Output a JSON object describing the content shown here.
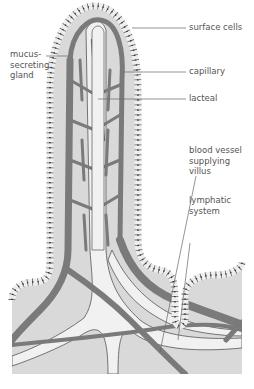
{
  "diagram": {
    "colors": {
      "tissue": "#d9d9d9",
      "lacteal": "#f1f1f1",
      "vessel": "#7a7a7a",
      "outline": "#555555",
      "cell": "#eeeeee",
      "text": "#555555"
    },
    "labels": [
      {
        "id": "surface-cells",
        "text": "surface cells"
      },
      {
        "id": "mucus-gland",
        "text": "mucus-\nsecreting\ngland"
      },
      {
        "id": "capillary",
        "text": "capillary"
      },
      {
        "id": "lacteal",
        "text": "lacteal"
      },
      {
        "id": "blood-vessel",
        "text": "blood vessel\nsupplying\nvillus"
      },
      {
        "id": "lymphatic",
        "text": "lymphatic\nsystem"
      }
    ]
  }
}
